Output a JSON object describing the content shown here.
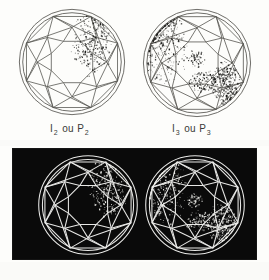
{
  "figure": {
    "background_color": "#fdfdfb",
    "dark_panel_color": "#0a0a0a",
    "line_color_light": "#55544f",
    "line_color_dark": "#e8e8e6",
    "inclusion_color_light": "#1c1c1a",
    "inclusion_color_dark": "#f2f2ee"
  },
  "captions": {
    "left": {
      "base": "I",
      "sub1": "2",
      "conj": " ou P",
      "sub2": "2",
      "full": "I2 ou P2"
    },
    "right": {
      "base": "I",
      "sub1": "3",
      "conj": " ou P",
      "sub2": "3",
      "full": "I3 ou P3"
    }
  },
  "diagrams": [
    {
      "id": "top-left",
      "grade": "I2 ou P2",
      "rendering": "positive",
      "cut": "round-brilliant",
      "facet_pattern": "table-star-bezel-upper-girdle",
      "inclusion_count": 1,
      "inclusions": [
        {
          "name": "cluster-upper-right",
          "cx": 0.68,
          "cy": 0.34,
          "rx": 0.16,
          "ry": 0.26,
          "density": "heavy"
        }
      ]
    },
    {
      "id": "top-right",
      "grade": "I3 ou P3",
      "rendering": "positive",
      "cut": "round-brilliant",
      "facet_pattern": "table-star-bezel-upper-girdle",
      "inclusion_count": 4,
      "inclusions": [
        {
          "name": "cluster-left-edge",
          "cx": 0.2,
          "cy": 0.33,
          "rx": 0.19,
          "ry": 0.32,
          "density": "heavy"
        },
        {
          "name": "cluster-center",
          "cx": 0.5,
          "cy": 0.46,
          "rx": 0.07,
          "ry": 0.07,
          "density": "light"
        },
        {
          "name": "cluster-lower-center",
          "cx": 0.56,
          "cy": 0.66,
          "rx": 0.14,
          "ry": 0.09,
          "density": "medium"
        },
        {
          "name": "cluster-lower-right",
          "cx": 0.76,
          "cy": 0.68,
          "rx": 0.12,
          "ry": 0.18,
          "density": "heavy"
        }
      ]
    },
    {
      "id": "bottom-left",
      "grade": "I2 ou P2",
      "rendering": "negative",
      "cut": "round-brilliant",
      "facet_pattern": "table-star-bezel-upper-girdle",
      "inclusion_count": 1,
      "inclusions": [
        {
          "name": "cluster-upper-right",
          "cx": 0.68,
          "cy": 0.34,
          "rx": 0.16,
          "ry": 0.26,
          "density": "heavy"
        }
      ]
    },
    {
      "id": "bottom-right",
      "grade": "I3 ou P3",
      "rendering": "negative",
      "cut": "round-brilliant",
      "facet_pattern": "table-star-bezel-upper-girdle",
      "inclusion_count": 4,
      "inclusions": [
        {
          "name": "cluster-left-edge",
          "cx": 0.2,
          "cy": 0.33,
          "rx": 0.19,
          "ry": 0.32,
          "density": "heavy"
        },
        {
          "name": "cluster-center",
          "cx": 0.5,
          "cy": 0.46,
          "rx": 0.07,
          "ry": 0.07,
          "density": "light"
        },
        {
          "name": "cluster-lower-center",
          "cx": 0.56,
          "cy": 0.66,
          "rx": 0.14,
          "ry": 0.09,
          "density": "medium"
        },
        {
          "name": "cluster-lower-right",
          "cx": 0.76,
          "cy": 0.68,
          "rx": 0.12,
          "ry": 0.18,
          "density": "heavy"
        }
      ]
    }
  ]
}
